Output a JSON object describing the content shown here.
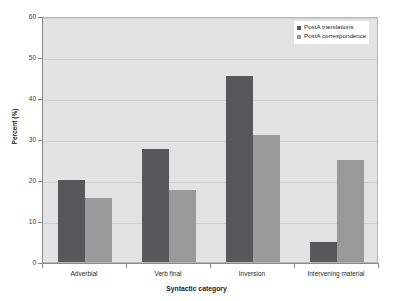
{
  "chart_data": {
    "type": "bar",
    "title": "",
    "categories": [
      "Adverbial",
      "Verb final",
      "Inversion",
      "Intervening material"
    ],
    "series": [
      {
        "name": "PostA translations",
        "values": [
          20,
          27.5,
          45.3,
          5
        ],
        "color": "#58585a"
      },
      {
        "name": "PostA correspondence",
        "values": [
          15.5,
          17.5,
          31,
          25
        ],
        "color": "#9a9a9a"
      }
    ],
    "xlabel": "Syntactic category",
    "ylabel": "Percent (%)",
    "ylim": [
      0,
      60
    ],
    "yticks": [
      0,
      10,
      20,
      30,
      40,
      50,
      60
    ],
    "ytick_labels": [
      "0",
      "10",
      "20",
      "30",
      "40",
      "50",
      "60"
    ],
    "grid": true,
    "legend_position": "top-right",
    "plot_background": "#e3e3e3",
    "figure_background": "#ffffff"
  }
}
